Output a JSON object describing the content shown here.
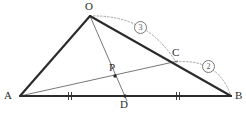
{
  "figure": {
    "type": "geometry-diagram",
    "width": 246,
    "height": 113,
    "background": "#ffffff"
  },
  "labels": {
    "O": "O",
    "A": "A",
    "B": "B",
    "C": "C",
    "D": "D",
    "P": "P"
  },
  "arc_labels": {
    "three": "3",
    "two": "2"
  },
  "colors": {
    "thick_stroke": "#2b2b2b",
    "thin_stroke": "#555555",
    "dotted_stroke": "#999999",
    "label_text": "#2b2b2b",
    "arc_label_text": "#555555"
  },
  "points": {
    "O": {
      "x": 90,
      "y": 16
    },
    "A": {
      "x": 20,
      "y": 96
    },
    "B": {
      "x": 231,
      "y": 96
    },
    "C": {
      "x": 176,
      "y": 62
    },
    "D": {
      "x": 125,
      "y": 96
    },
    "P": {
      "x": 115,
      "y": 76
    }
  },
  "label_positions": {
    "O": {
      "x": 85,
      "y": 2
    },
    "A": {
      "x": 5,
      "y": 91
    },
    "B": {
      "x": 235,
      "y": 91
    },
    "C": {
      "x": 173,
      "y": 48
    },
    "D": {
      "x": 120,
      "y": 99
    },
    "P": {
      "x": 110,
      "y": 62
    },
    "three": {
      "x": 135,
      "y": 22
    },
    "two": {
      "x": 203,
      "y": 61
    }
  },
  "segments": [
    {
      "name": "OA",
      "from": "O",
      "to": "A",
      "weight": "thick"
    },
    {
      "name": "OB",
      "from": "O",
      "to": "B",
      "weight": "thick"
    },
    {
      "name": "AB",
      "from": "A",
      "to": "B",
      "weight": "thick"
    },
    {
      "name": "OD",
      "from": "O",
      "to": "D",
      "weight": "thin"
    },
    {
      "name": "AC",
      "from": "A",
      "to": "C",
      "weight": "thin"
    }
  ],
  "arcs": [
    {
      "name": "arc-OC",
      "from": "O",
      "to": "C",
      "ratio": "3"
    },
    {
      "name": "arc-CB",
      "from": "C",
      "to": "B",
      "ratio": "2"
    }
  ],
  "tick_marks": [
    {
      "name": "tick-AD",
      "x": 70,
      "y": 96,
      "count": 2
    },
    {
      "name": "tick-DB",
      "x": 178,
      "y": 96,
      "count": 2
    }
  ]
}
